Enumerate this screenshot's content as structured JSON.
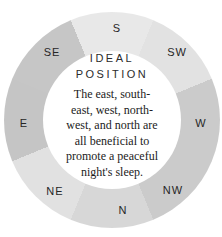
{
  "ring": {
    "order_note": "segments clockwise starting at top",
    "segments": [
      {
        "label": "S",
        "color": "#e8e8e8"
      },
      {
        "label": "SW",
        "color": "#e2e2e2"
      },
      {
        "label": "W",
        "color": "#cbcbcb"
      },
      {
        "label": "NW",
        "color": "#cbcbcb"
      },
      {
        "label": "N",
        "color": "#d7d7d7"
      },
      {
        "label": "NE",
        "color": "#e1e1e1"
      },
      {
        "label": "E",
        "color": "#c5c5c5"
      },
      {
        "label": "SE",
        "color": "#c6c6c6"
      }
    ],
    "inner_color": "#ffffff",
    "background_color": "#ffffff"
  },
  "center": {
    "title": "IDEAL POSITION",
    "body_text": "The east, south-east, west, north-west, and north are all beneficial to promote a peaceful night's sleep.",
    "body_lines": [
      "The east, south-",
      "east, west, north-",
      "west, and north are",
      "all beneficial to",
      "promote a peaceful",
      "night's sleep."
    ]
  }
}
